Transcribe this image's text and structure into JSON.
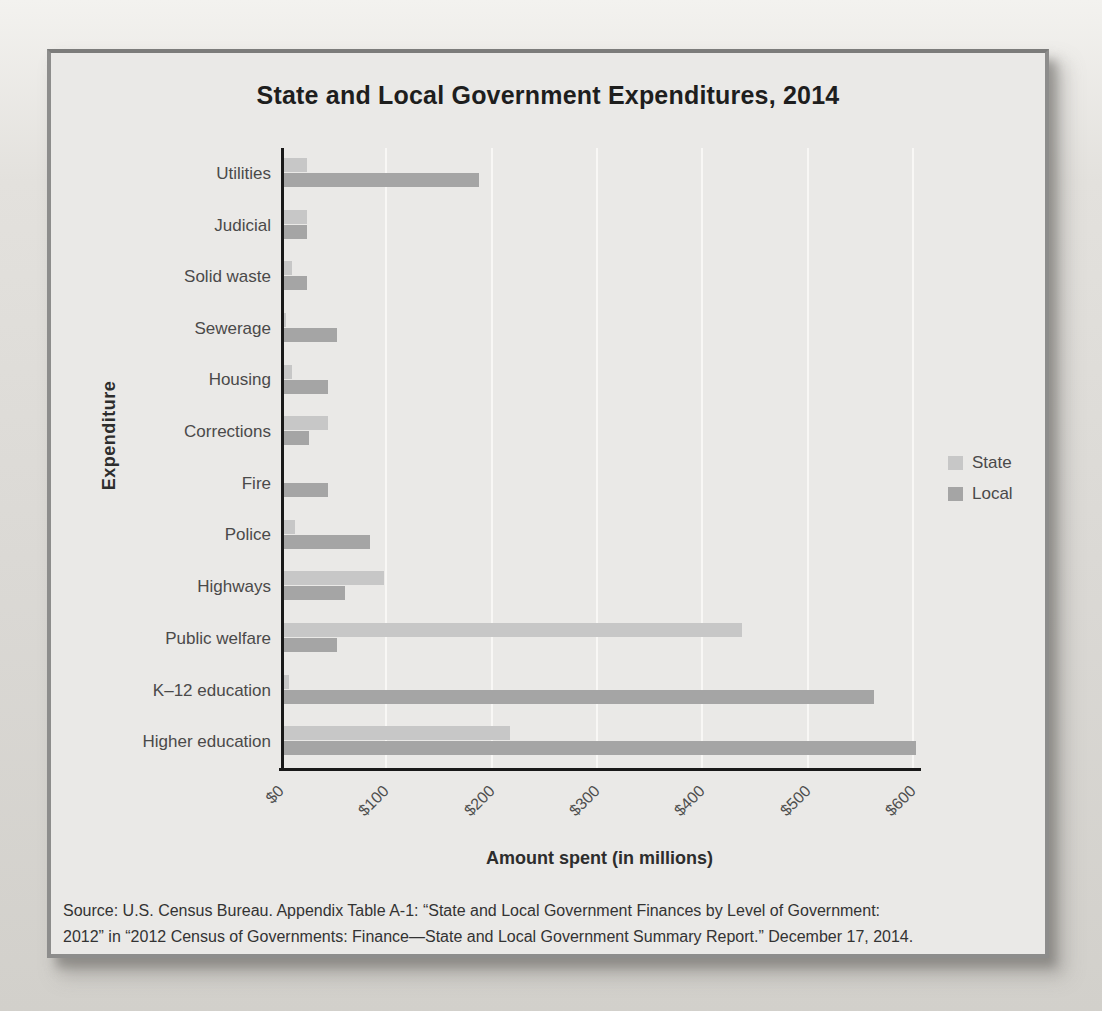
{
  "title": "State and Local Government Expenditures, 2014",
  "chart_data": {
    "type": "bar",
    "orientation": "horizontal",
    "title": "State and Local Government Expenditures, 2014",
    "categories": [
      "Utilities",
      "Judicial",
      "Solid waste",
      "Sewerage",
      "Housing",
      "Corrections",
      "Fire",
      "Police",
      "Highways",
      "Public welfare",
      "K–12 education",
      "Higher education"
    ],
    "series": [
      {
        "name": "State",
        "color": "#c7c7c7",
        "values": [
          22,
          22,
          8,
          2,
          8,
          42,
          0,
          10,
          95,
          435,
          5,
          215
        ]
      },
      {
        "name": "Local",
        "color": "#a5a5a5",
        "values": [
          185,
          22,
          22,
          50,
          42,
          24,
          42,
          82,
          58,
          50,
          560,
          600
        ]
      }
    ],
    "xlabel": "Amount spent (in millions)",
    "ylabel": "Expenditure",
    "x_ticks": [
      "$0",
      "$100",
      "$200",
      "$300",
      "$400",
      "$500",
      "$600"
    ],
    "x_tick_values": [
      0,
      100,
      200,
      300,
      400,
      500,
      600
    ],
    "xlim": [
      0,
      600
    ],
    "grid": "vertical",
    "legend_position": "right"
  },
  "axis": {
    "x_label": "Amount spent (in millions)",
    "y_label": "Expenditure"
  },
  "source": {
    "line1": "Source: U.S. Census Bureau. Appendix Table A-1: “State and Local Government Finances by Level of Government:",
    "line2": "2012” in “2012 Census of Governments: Finance—State and Local Government Summary Report.” December 17, 2014."
  },
  "colors": {
    "state_bar": "#c7c7c7",
    "local_bar": "#a5a5a5",
    "axis_line": "#191919",
    "gridline": "#f8f7f5",
    "panel_bg": "#eae9e7",
    "page_bg": "#dbd9d5",
    "title_text": "#1e1e1e",
    "label_text": "#4a4a4a"
  }
}
